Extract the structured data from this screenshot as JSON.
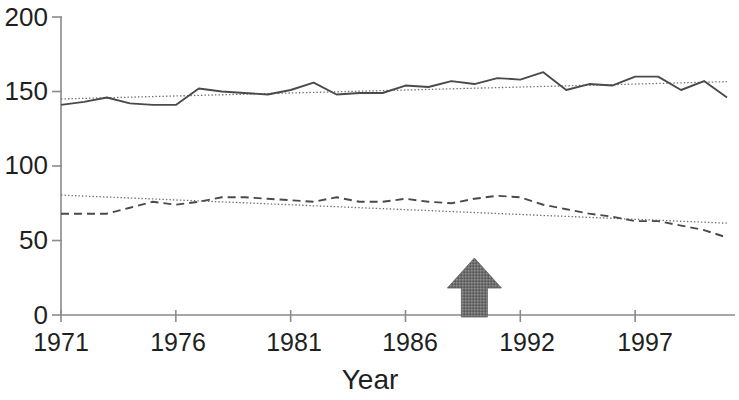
{
  "chart_data": {
    "type": "line",
    "title": "",
    "xlabel": "Year",
    "ylabel": "",
    "xlim": [
      1971,
      2000
    ],
    "ylim": [
      0,
      200
    ],
    "grid": false,
    "legend": "none",
    "x_tick_labels": [
      "1971",
      "1976",
      "1981",
      "1986",
      "1992",
      "1997"
    ],
    "x_tick_values": [
      1971,
      1976,
      1981,
      1986,
      1991,
      1996
    ],
    "y_tick_labels": [
      "0",
      "50",
      "100",
      "150",
      "200"
    ],
    "y_tick_values": [
      0,
      50,
      100,
      150,
      200
    ],
    "x": [
      1971,
      1972,
      1973,
      1974,
      1975,
      1976,
      1977,
      1978,
      1979,
      1980,
      1981,
      1982,
      1983,
      1984,
      1985,
      1986,
      1987,
      1988,
      1989,
      1990,
      1991,
      1992,
      1993,
      1994,
      1995,
      1996,
      1997,
      1998,
      1999,
      2000
    ],
    "series": [
      {
        "name": "upper-series",
        "style": "solid",
        "color": "#4a4a4a",
        "values": [
          141,
          143,
          146,
          142,
          141,
          141,
          152,
          150,
          149,
          148,
          151,
          156,
          148,
          149,
          149,
          154,
          153,
          157,
          155,
          159,
          158,
          163,
          151,
          155,
          154,
          160,
          160,
          151,
          157,
          146
        ]
      },
      {
        "name": "lower-series",
        "style": "dashed",
        "color": "#4a4a4a",
        "values": [
          68,
          68,
          68,
          72,
          76,
          74,
          76,
          79,
          79,
          78,
          77,
          76,
          79,
          76,
          76,
          78,
          76,
          75,
          78,
          80,
          79,
          74,
          71,
          68,
          66,
          63,
          63,
          60,
          57,
          52
        ]
      },
      {
        "name": "upper-trendline",
        "style": "dotted",
        "color": "#6e6e6e",
        "values": [
          145,
          145.4,
          145.8,
          146.2,
          146.6,
          147,
          147.4,
          147.8,
          148.2,
          148.6,
          149,
          149.4,
          149.8,
          150.2,
          150.6,
          151,
          151.4,
          151.8,
          152.2,
          152.6,
          153,
          153.4,
          153.8,
          154.2,
          154.6,
          155,
          155.4,
          155.8,
          156.2,
          156.6
        ]
      },
      {
        "name": "lower-trendline",
        "style": "dotted",
        "color": "#6e6e6e",
        "values": [
          80.5,
          79.8,
          79.2,
          78.5,
          77.9,
          77.2,
          76.6,
          75.9,
          75.3,
          74.6,
          74,
          73.3,
          72.7,
          72,
          71.4,
          70.7,
          70.1,
          69.4,
          68.8,
          68.1,
          67.5,
          66.8,
          66.2,
          65.5,
          64.9,
          64.2,
          63.6,
          62.9,
          62.3,
          61.6
        ]
      }
    ],
    "annotations": [
      {
        "name": "intervention-arrow",
        "type": "up-arrow",
        "x_value": 1989,
        "color": "#6b6b6b"
      }
    ]
  }
}
